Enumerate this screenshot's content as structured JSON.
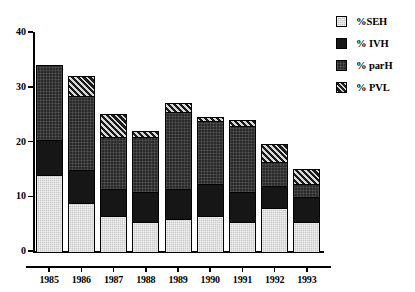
{
  "chart_data": {
    "type": "bar",
    "subtype": "stacked-bar",
    "title": "",
    "xlabel": "",
    "ylabel": "",
    "ylim": [
      0,
      40
    ],
    "yticks": [
      0,
      10,
      20,
      30,
      40
    ],
    "grid": false,
    "legend_position": "top-right",
    "categories": [
      "1985",
      "1986",
      "1987",
      "1988",
      "1989",
      "1990",
      "1991",
      "1992",
      "1993"
    ],
    "series": [
      {
        "name": "%SEH",
        "key": "seh",
        "color": "#c9c9c9",
        "pattern": "light-gray",
        "values": [
          14.0,
          9.0,
          6.5,
          5.5,
          6.0,
          6.5,
          5.5,
          8.0,
          5.5
        ]
      },
      {
        "name": "% IVH",
        "key": "ivh",
        "color": "#161616",
        "pattern": "solid-black",
        "values": [
          6.5,
          6.0,
          5.0,
          5.5,
          5.5,
          6.0,
          5.5,
          4.0,
          4.5
        ]
      },
      {
        "name": "% parH",
        "key": "parh",
        "color": "#2a2a2a",
        "pattern": "dark-dotted",
        "values": [
          13.5,
          13.5,
          9.5,
          10.0,
          14.0,
          11.5,
          12.0,
          4.5,
          2.5
        ]
      },
      {
        "name": "% PVL",
        "key": "pvl",
        "color": "#1b1b1b",
        "pattern": "diagonal-hatch",
        "values": [
          0.0,
          3.5,
          4.0,
          1.0,
          1.5,
          0.5,
          1.0,
          3.0,
          2.5
        ]
      }
    ],
    "totals": [
      34.0,
      32.0,
      25.0,
      22.0,
      27.0,
      24.5,
      24.0,
      19.5,
      15.0
    ]
  },
  "legend": {
    "items": [
      {
        "label": "%SEH",
        "key": "seh"
      },
      {
        "label": "% IVH",
        "key": "ivh"
      },
      {
        "label": "% parH",
        "key": "parh"
      },
      {
        "label": "% PVL",
        "key": "pvl"
      }
    ]
  }
}
